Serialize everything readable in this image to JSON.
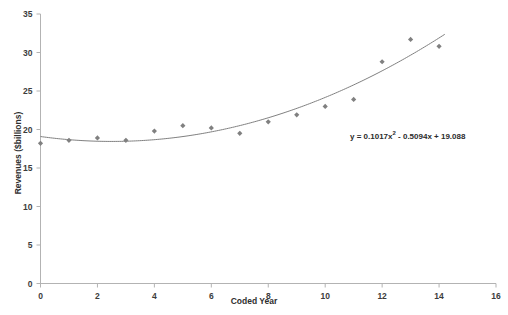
{
  "chart_data": {
    "type": "scatter",
    "title": "",
    "xlabel": "Coded Year",
    "ylabel": "Revenues ($billions)",
    "xlim": [
      0,
      16
    ],
    "ylim": [
      0,
      35
    ],
    "xticks": [
      0,
      2,
      4,
      6,
      8,
      10,
      12,
      14,
      16
    ],
    "xtick_labels": [
      "0",
      "2",
      "4",
      "6",
      "8",
      "10",
      "12",
      "14",
      "16"
    ],
    "yticks": [
      0,
      5,
      10,
      15,
      20,
      25,
      30,
      35
    ],
    "ytick_labels": [
      "0",
      "5",
      "10",
      "15",
      "20",
      "25",
      "30",
      "35"
    ],
    "grid": false,
    "legend": "none",
    "marker": "diamond",
    "marker_color": "#808080",
    "trendline_color": "#808080",
    "x": [
      0,
      1,
      2,
      3,
      4,
      5,
      6,
      7,
      8,
      9,
      10,
      11,
      12,
      13,
      14
    ],
    "values": [
      18.2,
      18.6,
      18.9,
      18.6,
      19.8,
      20.5,
      20.2,
      19.5,
      21.0,
      21.9,
      23.0,
      23.9,
      28.8,
      31.7,
      30.8
    ],
    "series": [
      {
        "name": "Revenues",
        "values": [
          18.2,
          18.6,
          18.9,
          18.6,
          19.8,
          20.5,
          20.2,
          19.5,
          21.0,
          21.9,
          23.0,
          23.9,
          28.8,
          31.7,
          30.8
        ]
      }
    ],
    "trendline": {
      "type": "polynomial",
      "degree": 2,
      "a": 0.1017,
      "b": -0.5094,
      "c": 19.088,
      "x_start": 0,
      "x_end": 14.2
    },
    "annotations": [
      {
        "name": "trendline-equation",
        "text_prefix": "y = 0.1017x",
        "text_sup": "2",
        "text_suffix": " - 0.5094x + 19.088",
        "full_text": "y = 0.1017x2 - 0.5094x + 19.088"
      }
    ]
  },
  "axis": {
    "x_title": "Coded Year",
    "y_title": "Revenues ($billions)"
  }
}
